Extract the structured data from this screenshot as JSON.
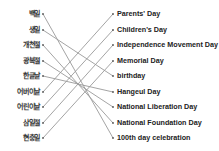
{
  "exercise": {
    "left_items": [
      {
        "label": "백일"
      },
      {
        "label": "생일"
      },
      {
        "label": "개천절"
      },
      {
        "label": "광복절"
      },
      {
        "label": "한글날"
      },
      {
        "label": "어버이날"
      },
      {
        "label": "어린이날"
      },
      {
        "label": "삼일절"
      },
      {
        "label": "현충일"
      }
    ],
    "right_items": [
      {
        "label": "Parents' Day"
      },
      {
        "label": "Children's Day"
      },
      {
        "label": "Independence Movement Day"
      },
      {
        "label": "Memorial Day"
      },
      {
        "label": "birthday"
      },
      {
        "label": "Hangeul Day"
      },
      {
        "label": "National Liberation Day"
      },
      {
        "label": "National Foundation Day"
      },
      {
        "label": "100th day celebration"
      }
    ],
    "connections": [
      [
        0,
        8
      ],
      [
        1,
        4
      ],
      [
        2,
        7
      ],
      [
        3,
        6
      ],
      [
        4,
        5
      ],
      [
        5,
        0
      ],
      [
        6,
        1
      ],
      [
        7,
        2
      ],
      [
        8,
        3
      ]
    ],
    "line_color": "#9a9a9a"
  }
}
